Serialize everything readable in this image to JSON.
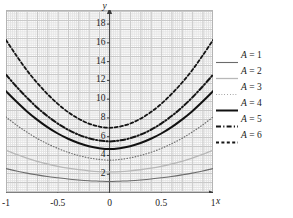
{
  "chart_data": {
    "type": "line",
    "title": "",
    "xlabel": "x",
    "ylabel": "y",
    "xlim": [
      -1,
      1
    ],
    "ylim": [
      0,
      19.5
    ],
    "grid": true,
    "legend_position": "right",
    "xticks": [
      "-1",
      "-0.5",
      "0",
      "0.5",
      "1"
    ],
    "xtick_values": [
      -1,
      -0.5,
      0,
      0.5,
      1
    ],
    "yticks": [
      "2",
      "4",
      "6",
      "8",
      "10",
      "12",
      "14",
      "16",
      "18"
    ],
    "ytick_values": [
      2,
      4,
      6,
      8,
      10,
      12,
      14,
      16,
      18
    ],
    "x": [
      -1,
      -0.9,
      -0.8,
      -0.7,
      -0.6,
      -0.5,
      -0.4,
      -0.3,
      -0.2,
      -0.1,
      0,
      0.1,
      0.2,
      0.3,
      0.4,
      0.5,
      0.6,
      0.7,
      0.8,
      0.9,
      1
    ],
    "series": [
      {
        "name": "A = 1",
        "label": "A = 1",
        "A": 1,
        "color": "#6b6b6b",
        "style": "solid",
        "width": 1.1,
        "values": [
          2.6,
          2.35,
          2.12,
          1.93,
          1.76,
          1.62,
          1.49,
          1.39,
          1.31,
          1.26,
          1.22,
          1.26,
          1.31,
          1.39,
          1.49,
          1.62,
          1.76,
          1.93,
          2.12,
          2.35,
          2.6
        ]
      },
      {
        "name": "A = 2",
        "label": "A = 2",
        "A": 2,
        "color": "#b8b8b8",
        "style": "solid",
        "width": 1.3,
        "values": [
          4.55,
          4.12,
          3.72,
          3.38,
          3.09,
          2.84,
          2.64,
          2.48,
          2.36,
          2.28,
          2.25,
          2.28,
          2.36,
          2.48,
          2.64,
          2.84,
          3.09,
          3.38,
          3.72,
          4.12,
          4.55
        ]
      },
      {
        "name": "A = 3",
        "label": "A = 3",
        "A": 3,
        "color": "#707070",
        "style": "dotted",
        "width": 1.2,
        "values": [
          8.1,
          7.25,
          6.5,
          5.82,
          5.25,
          4.75,
          4.33,
          4.0,
          3.74,
          3.58,
          3.5,
          3.58,
          3.74,
          4.0,
          4.33,
          4.75,
          5.25,
          5.82,
          6.5,
          7.25,
          8.1
        ]
      },
      {
        "name": "A = 4",
        "label": "A = 4",
        "A": 4,
        "color": "#111111",
        "style": "solid",
        "width": 2.0,
        "values": [
          10.85,
          9.75,
          8.72,
          7.82,
          7.02,
          6.34,
          5.78,
          5.33,
          4.99,
          4.78,
          4.68,
          4.78,
          4.99,
          5.33,
          5.78,
          6.34,
          7.02,
          7.82,
          8.72,
          9.75,
          10.85
        ]
      },
      {
        "name": "A = 5",
        "label": "A = 5",
        "A": 5,
        "color": "#151515",
        "style": "dashdot",
        "width": 2.0,
        "values": [
          12.6,
          11.35,
          10.18,
          9.12,
          8.2,
          7.4,
          6.74,
          6.22,
          5.84,
          5.6,
          5.5,
          5.6,
          5.84,
          6.22,
          6.74,
          7.4,
          8.2,
          9.12,
          10.18,
          11.35,
          12.6
        ]
      },
      {
        "name": "A = 6",
        "label": "A = 6",
        "A": 6,
        "color": "#151515",
        "style": "dashed",
        "width": 1.8,
        "values": [
          16.3,
          14.65,
          13.1,
          11.75,
          10.55,
          9.5,
          8.62,
          7.92,
          7.4,
          7.08,
          6.95,
          7.08,
          7.4,
          7.92,
          8.62,
          9.5,
          10.55,
          11.75,
          13.1,
          14.65,
          16.3
        ]
      }
    ]
  },
  "axes": {
    "x_axis_label": "x",
    "y_axis_label": "y"
  },
  "legend": {
    "entries": [
      {
        "label": "A = 1"
      },
      {
        "label": "A = 2"
      },
      {
        "label": "A = 3"
      },
      {
        "label": "A = 4"
      },
      {
        "label": "A = 5"
      },
      {
        "label": "A = 6"
      }
    ]
  }
}
